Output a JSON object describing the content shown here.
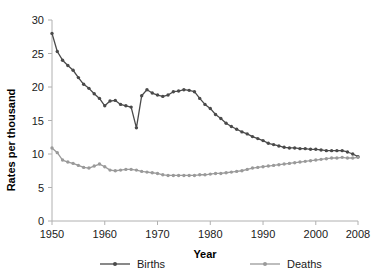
{
  "chart_data": {
    "type": "line",
    "title": "",
    "xlabel": "Year",
    "ylabel": "Rates per thousand",
    "xlim": [
      1950,
      2008
    ],
    "ylim": [
      0,
      30
    ],
    "xticks": [
      1950,
      1960,
      1970,
      1980,
      1990,
      2000,
      2008
    ],
    "yticks": [
      0,
      5,
      10,
      15,
      20,
      25,
      30
    ],
    "grid": false,
    "legend_position": "bottom",
    "x": [
      1950,
      1951,
      1952,
      1953,
      1954,
      1955,
      1956,
      1957,
      1958,
      1959,
      1960,
      1961,
      1962,
      1963,
      1964,
      1965,
      1966,
      1967,
      1968,
      1969,
      1970,
      1971,
      1972,
      1973,
      1974,
      1975,
      1976,
      1977,
      1978,
      1979,
      1980,
      1981,
      1982,
      1983,
      1984,
      1985,
      1986,
      1987,
      1988,
      1989,
      1990,
      1991,
      1992,
      1993,
      1994,
      1995,
      1996,
      1997,
      1998,
      1999,
      2000,
      2001,
      2002,
      2003,
      2004,
      2005,
      2006,
      2007,
      2008
    ],
    "series": [
      {
        "name": "Births",
        "color": "#4a4a4a",
        "marker": "circle",
        "values": [
          28.0,
          25.3,
          24.0,
          23.2,
          22.5,
          21.4,
          20.4,
          19.8,
          19.0,
          18.3,
          17.2,
          17.9,
          18.0,
          17.4,
          17.2,
          17.0,
          13.9,
          18.7,
          19.6,
          19.1,
          18.8,
          18.6,
          18.8,
          19.3,
          19.4,
          19.6,
          19.5,
          19.3,
          18.3,
          17.4,
          16.8,
          15.9,
          15.3,
          14.6,
          14.1,
          13.7,
          13.3,
          13.0,
          12.6,
          12.3,
          12.0,
          11.6,
          11.4,
          11.2,
          11.0,
          10.9,
          10.9,
          10.8,
          10.8,
          10.7,
          10.7,
          10.6,
          10.5,
          10.5,
          10.5,
          10.5,
          10.3,
          10.0,
          9.6
        ]
      },
      {
        "name": "Deaths",
        "color": "#9a9a9a",
        "marker": "circle",
        "values": [
          10.9,
          10.2,
          9.1,
          8.8,
          8.6,
          8.3,
          8.0,
          7.9,
          8.2,
          8.5,
          8.1,
          7.6,
          7.5,
          7.6,
          7.7,
          7.7,
          7.6,
          7.4,
          7.3,
          7.2,
          7.1,
          6.9,
          6.8,
          6.8,
          6.8,
          6.8,
          6.8,
          6.8,
          6.9,
          6.9,
          7.0,
          7.1,
          7.1,
          7.2,
          7.3,
          7.4,
          7.5,
          7.7,
          7.9,
          8.0,
          8.1,
          8.2,
          8.3,
          8.4,
          8.5,
          8.6,
          8.7,
          8.8,
          8.9,
          9.0,
          9.1,
          9.2,
          9.3,
          9.4,
          9.4,
          9.5,
          9.4,
          9.4,
          9.5
        ]
      }
    ]
  },
  "axis": {
    "y_title": "Rates per thousand",
    "x_title": "Year",
    "y_tick_labels": [
      "0",
      "5",
      "10",
      "15",
      "20",
      "25",
      "30"
    ],
    "x_tick_labels": [
      "1950",
      "1960",
      "1970",
      "1980",
      "1990",
      "2000",
      "2008"
    ]
  },
  "legend": {
    "entries": [
      {
        "label": "Births"
      },
      {
        "label": "Deaths"
      }
    ]
  }
}
